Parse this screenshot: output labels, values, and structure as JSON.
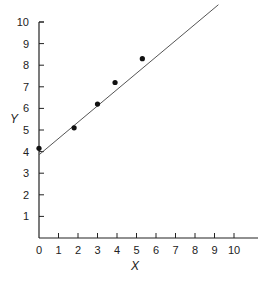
{
  "chart_data": {
    "type": "scatter",
    "title": "",
    "xlabel": "X",
    "ylabel": "Y",
    "xlim": [
      0,
      10
    ],
    "ylim": [
      0,
      10
    ],
    "x_ticks": [
      0,
      1,
      2,
      3,
      4,
      5,
      6,
      7,
      8,
      9,
      10
    ],
    "y_ticks": [
      1,
      2,
      3,
      4,
      5,
      6,
      7,
      8,
      9,
      10
    ],
    "grid": false,
    "legend": null,
    "series": [
      {
        "name": "observations",
        "type": "scatter",
        "x": [
          0,
          1.8,
          3.0,
          3.9,
          5.3
        ],
        "y": [
          4.15,
          5.1,
          6.2,
          7.2,
          8.3
        ]
      },
      {
        "name": "fit line",
        "type": "line",
        "x": [
          0,
          9.2
        ],
        "y": [
          3.85,
          10.8
        ]
      }
    ],
    "colors": {
      "axis": "#222222",
      "points": "#111111",
      "line": "#555555"
    }
  }
}
